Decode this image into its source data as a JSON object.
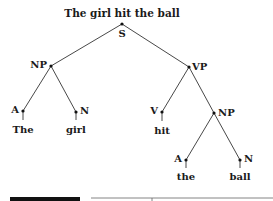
{
  "diagram": {
    "type": "parse-tree",
    "sentence": "The girl hit the ball",
    "nodes": {
      "S": "S",
      "NP1": "NP",
      "VP": "VP",
      "A1": "A",
      "N1": "N",
      "V": "V",
      "NP2": "NP",
      "A2": "A",
      "N2": "N"
    },
    "words": {
      "w1": "The",
      "w2": "girl",
      "w3": "hit",
      "w4": "the",
      "w5": "ball"
    },
    "edges": [
      [
        "S",
        "NP1"
      ],
      [
        "S",
        "VP"
      ],
      [
        "NP1",
        "A1"
      ],
      [
        "NP1",
        "N1"
      ],
      [
        "VP",
        "V"
      ],
      [
        "VP",
        "NP2"
      ],
      [
        "NP2",
        "A2"
      ],
      [
        "NP2",
        "N2"
      ]
    ]
  }
}
